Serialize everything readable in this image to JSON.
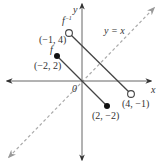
{
  "diagram": {
    "axes": {
      "x_label": "x",
      "y_label": "y",
      "origin_label": "0",
      "color": "#555555"
    },
    "reflection_line": {
      "label": "y = x",
      "style": "dashed",
      "color": "#aaaaaa"
    },
    "functions": [
      {
        "label": "f",
        "color": "#444444",
        "segment": {
          "start": {
            "x": -2,
            "y": 2,
            "label": "(−2, 2)",
            "marker": "filled"
          },
          "end": {
            "x": 2,
            "y": -2,
            "label": "(2, −2)",
            "marker": "filled"
          }
        }
      },
      {
        "label": "f⁻¹",
        "label_base": "f",
        "label_sup": "−1",
        "color": "#444444",
        "segment": {
          "start": {
            "x": -1,
            "y": 4,
            "label": "(−1, 4)",
            "marker": "open"
          },
          "end": {
            "x": 4,
            "y": -1,
            "label": "(4, −1)",
            "marker": "open"
          }
        }
      }
    ]
  }
}
